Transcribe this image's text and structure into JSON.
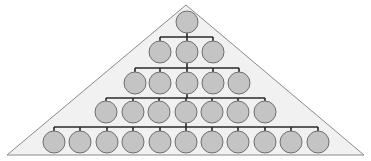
{
  "diagram": {
    "type": "hierarchy-pyramid",
    "colors": {
      "background": "#ffffff",
      "triangle_fill": "#f1f1f1",
      "triangle_stroke": "#8a8a8a",
      "node_fill": "#c4c4c4",
      "node_stroke": "#6e6e6e",
      "connector": "#2a2a2a"
    },
    "triangle": {
      "apex": [
        186,
        5
      ],
      "base_left": [
        7,
        155
      ],
      "base_right": [
        364,
        155
      ]
    },
    "node_radius": 11,
    "rows": [
      {
        "level": 1,
        "y": 22,
        "count": 1,
        "x": [
          187
        ]
      },
      {
        "level": 2,
        "y": 52,
        "count": 3,
        "x": [
          160,
          187,
          213
        ]
      },
      {
        "level": 3,
        "y": 83,
        "count": 5,
        "x": [
          135,
          160,
          187,
          213,
          239
        ]
      },
      {
        "level": 4,
        "y": 112,
        "count": 7,
        "x": [
          106,
          133,
          159,
          186,
          212,
          238,
          265
        ]
      },
      {
        "level": 5,
        "y": 142,
        "count": 11,
        "x": [
          54,
          80,
          107,
          133,
          160,
          186,
          212,
          238,
          265,
          291,
          318
        ]
      }
    ]
  }
}
